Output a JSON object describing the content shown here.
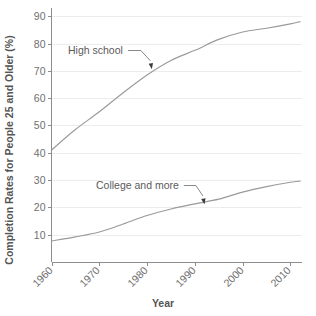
{
  "chart_data": {
    "type": "line",
    "title": "",
    "xlabel": "Year",
    "ylabel": "Completion Rates for People 25 and Older (%)",
    "x": [
      1960,
      1965,
      1970,
      1975,
      1980,
      1985,
      1990,
      1995,
      2000,
      2005,
      2010,
      2012
    ],
    "xlim": [
      1960,
      2012
    ],
    "ylim": [
      0,
      93
    ],
    "xticks": [
      1960,
      1970,
      1980,
      1990,
      2000,
      2010
    ],
    "xtick_labels": [
      "1960",
      "1970",
      "1980",
      "1990",
      "2000",
      "2010"
    ],
    "yticks": [
      10,
      20,
      30,
      40,
      50,
      60,
      70,
      80,
      90
    ],
    "ytick_labels": [
      "10",
      "20",
      "30",
      "40",
      "50",
      "60",
      "70",
      "80",
      "90"
    ],
    "grid": "horizontal-faint",
    "legend": "none-inline-annotations",
    "series": [
      {
        "name": "High school",
        "color": "#9a9a9a",
        "values": [
          41.0,
          48.5,
          55.0,
          62.0,
          68.5,
          73.8,
          77.5,
          81.5,
          84.2,
          85.6,
          87.2,
          88.0
        ]
      },
      {
        "name": "College and more",
        "color": "#9a9a9a",
        "values": [
          7.7,
          9.2,
          11.0,
          13.9,
          17.0,
          19.4,
          21.3,
          23.0,
          25.6,
          27.6,
          29.2,
          29.6
        ]
      }
    ],
    "annotations": [
      {
        "text": "High school",
        "points_to_year": 1981,
        "points_to_value": 70.0
      },
      {
        "text": "College and more",
        "points_to_year": 1992,
        "points_to_value": 20.5
      }
    ]
  }
}
